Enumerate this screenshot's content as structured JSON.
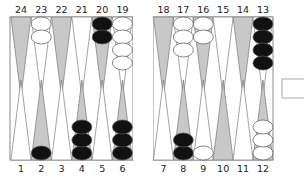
{
  "game": "Backgammon",
  "colors": {
    "board_bg": "#ffffff",
    "frame": "#8a8a8a",
    "point_dark": "#c8c8c8",
    "point_light": "#ffffff",
    "point_stroke": "#666666",
    "checker_black": "#111111",
    "checker_white": "#ffffff",
    "checker_stroke": "#555555"
  },
  "top_labels": [
    "24",
    "23",
    "22",
    "21",
    "20",
    "19",
    "18",
    "17",
    "16",
    "15",
    "14",
    "13"
  ],
  "bottom_labels": [
    "1",
    "2",
    "3",
    "4",
    "5",
    "6",
    "7",
    "8",
    "9",
    "10",
    "11",
    "12"
  ],
  "points": {
    "24": {
      "shade": "dark",
      "checkers": 0,
      "color": null
    },
    "23": {
      "shade": "light",
      "checkers": 2,
      "color": "white"
    },
    "22": {
      "shade": "dark",
      "checkers": 0,
      "color": null
    },
    "21": {
      "shade": "light",
      "checkers": 0,
      "color": null
    },
    "20": {
      "shade": "dark",
      "checkers": 2,
      "color": "black"
    },
    "19": {
      "shade": "light",
      "checkers": 4,
      "color": "white"
    },
    "18": {
      "shade": "dark",
      "checkers": 0,
      "color": null
    },
    "17": {
      "shade": "light",
      "checkers": 3,
      "color": "white"
    },
    "16": {
      "shade": "dark",
      "checkers": 2,
      "color": "white"
    },
    "15": {
      "shade": "light",
      "checkers": 0,
      "color": null
    },
    "14": {
      "shade": "dark",
      "checkers": 0,
      "color": null
    },
    "13": {
      "shade": "light",
      "checkers": 4,
      "color": "black"
    },
    "1": {
      "shade": "light",
      "checkers": 0,
      "color": null
    },
    "2": {
      "shade": "dark",
      "checkers": 1,
      "color": "black"
    },
    "3": {
      "shade": "light",
      "checkers": 0,
      "color": null
    },
    "4": {
      "shade": "dark",
      "checkers": 3,
      "color": "black"
    },
    "5": {
      "shade": "light",
      "checkers": 0,
      "color": null
    },
    "6": {
      "shade": "dark",
      "checkers": 3,
      "color": "black"
    },
    "7": {
      "shade": "light",
      "checkers": 0,
      "color": null
    },
    "8": {
      "shade": "dark",
      "checkers": 2,
      "color": "black"
    },
    "9": {
      "shade": "light",
      "checkers": 1,
      "color": "white"
    },
    "10": {
      "shade": "dark",
      "checkers": 0,
      "color": null
    },
    "11": {
      "shade": "light",
      "checkers": 0,
      "color": null
    },
    "12": {
      "shade": "dark",
      "checkers": 3,
      "color": "white"
    }
  },
  "bar": {
    "black": 0,
    "white": 0
  },
  "doubling_cube": {
    "visible": true,
    "value": ""
  }
}
